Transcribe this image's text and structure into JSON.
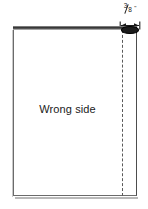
{
  "diagram": {
    "type": "sewing-fabric-fold-diagram",
    "fabric": {
      "label": "Wrong side"
    },
    "dimension": {
      "numerator": "3",
      "denominator": "8",
      "unit_symbol": "\"",
      "full_text": "3/8\"",
      "description": "seam allowance width measured from right edge to fold line"
    },
    "fold_line": {
      "style": "dashed",
      "name": "fold-line"
    },
    "seam_band": {
      "name": "top-seam-band",
      "color": "#2e2e2e"
    },
    "seam_oval": {
      "name": "seam-oval"
    }
  },
  "colors": {
    "ink": "#1a1a1a",
    "fabric_edge": "#6b6b6b",
    "seam_dark": "#2e2e2e",
    "fold_dash": "#5a5a5a",
    "background": "#ffffff"
  }
}
